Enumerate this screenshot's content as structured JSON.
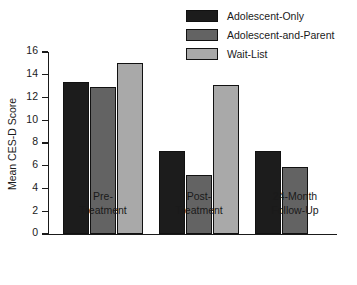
{
  "chart_data": {
    "type": "bar",
    "title": "",
    "subtitle": "",
    "xlabel": "",
    "ylabel": "Mean CES-D Score",
    "ylim": [
      0,
      16
    ],
    "yticks": [
      0,
      2,
      4,
      6,
      8,
      10,
      12,
      14,
      16
    ],
    "ytick_labels": [
      "0",
      "2",
      "4",
      "6",
      "8",
      "10",
      "12",
      "14",
      "16"
    ],
    "grid": false,
    "legend_position": "top-right",
    "categories": [
      "Pre-\nTreatment",
      "Post-\nTreatment",
      "24-Month\nFollow-Up"
    ],
    "category_labels_flat": [
      "Pre-Treatment",
      "Post-Treatment",
      "24-Month Follow-Up"
    ],
    "series": [
      {
        "name": "Adolescent-Only",
        "color": "#1c1c1c",
        "values": [
          13.4,
          7.3,
          7.3
        ]
      },
      {
        "name": "Adolescent-and-Parent",
        "color": "#636363",
        "values": [
          12.9,
          5.2,
          5.9
        ]
      },
      {
        "name": "Wait-List",
        "color": "#a9a9a9",
        "values": [
          15.0,
          13.1,
          null
        ]
      }
    ]
  },
  "legend": {
    "entries": [
      {
        "label": "Adolescent-Only",
        "color": "#1c1c1c"
      },
      {
        "label": "Adolescent-and-Parent",
        "color": "#636363"
      },
      {
        "label": "Wait-List",
        "color": "#a9a9a9"
      }
    ]
  },
  "axes": {
    "y_title": "Mean CES-D Score",
    "y_ticks": [
      "16",
      "14",
      "12",
      "10",
      "8",
      "6",
      "4",
      "2",
      "0"
    ],
    "x_categories": [
      "Pre-\nTreatment",
      "Post-\nTreatment",
      "24-Month\nFollow-Up"
    ]
  }
}
